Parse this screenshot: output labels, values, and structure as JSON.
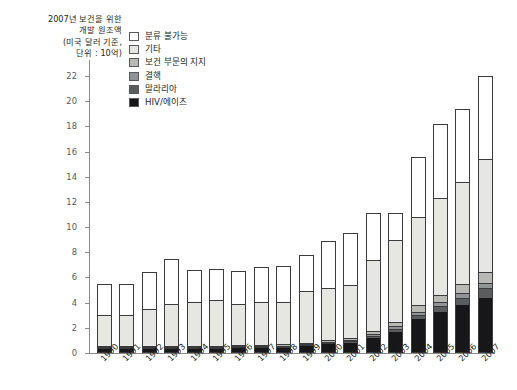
{
  "title": {
    "text": "2007년 보건을 위한\n개발 원조액\n(미국 달러 기준,\n단위 : 10억)"
  },
  "legend": {
    "position": "top-left-inside",
    "items": [
      {
        "label": "분류 불가능",
        "color": "#ffffff"
      },
      {
        "label": "기타",
        "color": "#e6e7e3"
      },
      {
        "label": "보건 부문의 지지",
        "color": "#b8b9b4"
      },
      {
        "label": "결핵",
        "color": "#929396"
      },
      {
        "label": "말라리아",
        "color": "#5b5c5e"
      },
      {
        "label": "HIV/에이즈",
        "color": "#17171a"
      }
    ]
  },
  "axes": {
    "y_ticks": [
      0,
      2,
      4,
      6,
      8,
      10,
      12,
      14,
      16,
      18,
      20,
      22
    ],
    "y_min": 0,
    "y_max": 22,
    "x_label_rotation": "-45deg"
  },
  "chart_data": {
    "type": "bar",
    "stacked": true,
    "title": "2007년 보건을 위한 개발 원조액 (미국 달러 기준, 단위 : 10억)",
    "xlabel": "",
    "ylabel": "",
    "ylim": [
      0,
      22
    ],
    "grid": false,
    "legend_position": "top-left-inside",
    "categories": [
      "1990",
      "1991",
      "1992",
      "1993",
      "1994",
      "1995",
      "1996",
      "1997",
      "1998",
      "1999",
      "2000",
      "2001",
      "2002",
      "2003",
      "2004",
      "2005",
      "2006",
      "2007"
    ],
    "series": [
      {
        "name": "HIV/에이즈",
        "color": "#17171a",
        "values": [
          0.2,
          0.2,
          0.22,
          0.22,
          0.25,
          0.25,
          0.28,
          0.3,
          0.35,
          0.45,
          0.6,
          0.75,
          1.1,
          1.6,
          2.6,
          3.2,
          3.7,
          4.3
        ]
      },
      {
        "name": "말라리아",
        "color": "#5b5c5e",
        "values": [
          0.03,
          0.03,
          0.03,
          0.04,
          0.04,
          0.04,
          0.05,
          0.05,
          0.06,
          0.08,
          0.1,
          0.12,
          0.18,
          0.25,
          0.35,
          0.45,
          0.6,
          0.75
        ]
      },
      {
        "name": "결핵",
        "color": "#929396",
        "values": [
          0.02,
          0.02,
          0.02,
          0.02,
          0.03,
          0.03,
          0.03,
          0.04,
          0.04,
          0.05,
          0.07,
          0.09,
          0.12,
          0.18,
          0.25,
          0.3,
          0.4,
          0.45
        ]
      },
      {
        "name": "보건 부문의 지지",
        "color": "#b8b9b4",
        "values": [
          0.05,
          0.05,
          0.05,
          0.06,
          0.06,
          0.07,
          0.07,
          0.08,
          0.09,
          0.1,
          0.14,
          0.18,
          0.25,
          0.35,
          0.5,
          0.6,
          0.7,
          0.85
        ]
      },
      {
        "name": "기타",
        "color": "#e6e7e3",
        "values": [
          2.5,
          2.5,
          2.98,
          3.38,
          3.52,
          3.61,
          3.31,
          3.43,
          3.36,
          4.1,
          4.2,
          4.21,
          5.65,
          6.52,
          7.0,
          7.65,
          8.1,
          8.95
        ]
      },
      {
        "name": "분류 불가능",
        "color": "#ffffff",
        "values": [
          2.7,
          2.7,
          3.1,
          3.78,
          2.7,
          2.7,
          2.76,
          2.9,
          3.0,
          3.02,
          3.79,
          4.15,
          3.8,
          2.2,
          4.9,
          6.0,
          5.9,
          6.7
        ]
      }
    ],
    "totals": [
      5.5,
      5.5,
      6.4,
      7.5,
      6.6,
      6.7,
      6.5,
      6.8,
      6.9,
      7.8,
      8.9,
      9.5,
      11.1,
      11.1,
      15.6,
      18.2,
      19.4,
      22.0
    ]
  }
}
